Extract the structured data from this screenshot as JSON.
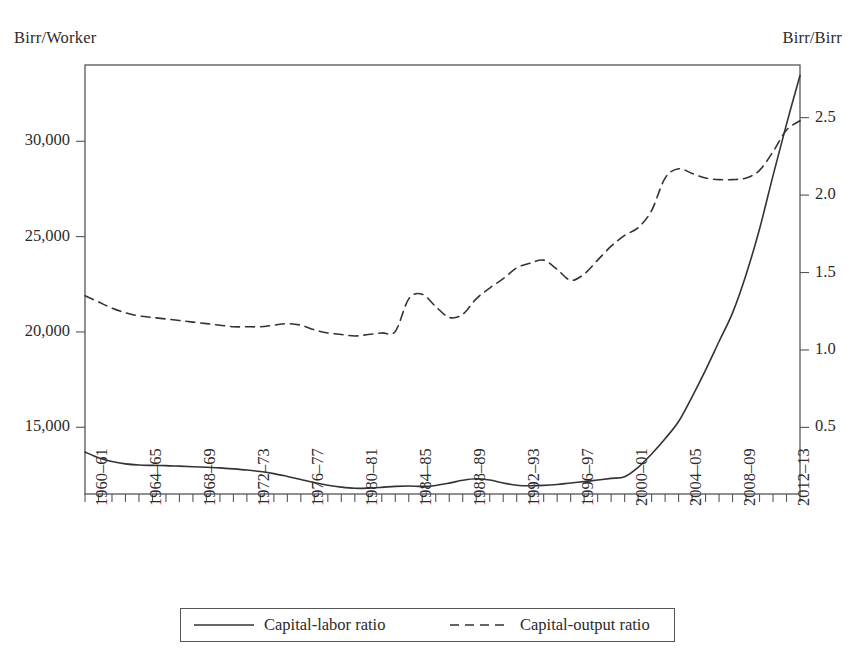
{
  "axes": {
    "left_title": "Birr/Worker",
    "right_title": "Birr/Birr",
    "left_ticks": [
      "15,000",
      "20,000",
      "25,000",
      "30,000"
    ],
    "right_ticks": [
      "0.5",
      "1.0",
      "1.5",
      "2.0",
      "2.5"
    ],
    "x_ticks": [
      "1960–61",
      "1964–65",
      "1968–69",
      "1972–73",
      "1976–77",
      "1980–81",
      "1984–85",
      "1988–89",
      "1992–93",
      "1996–97",
      "2000–01",
      "2004–05",
      "2008–09",
      "2012–13"
    ]
  },
  "legend": {
    "items": [
      {
        "label": "Capital-labor ratio",
        "style": "solid"
      },
      {
        "label": "Capital-output ratio",
        "style": "dashed"
      }
    ]
  },
  "style": {
    "line_color": "#333333",
    "axis_color": "#555555",
    "background": "#ffffff"
  },
  "chart_data": {
    "type": "line",
    "title": "",
    "xlabel": "",
    "ylabel": "Birr/Worker",
    "y2label": "Birr/Birr",
    "grid": false,
    "legend_position": "bottom",
    "ylim": [
      11500,
      34000
    ],
    "y2lim": [
      0.07,
      2.84
    ],
    "yticks": [
      15000,
      20000,
      25000,
      30000
    ],
    "y2ticks": [
      0.5,
      1.0,
      1.5,
      2.0,
      2.5
    ],
    "x": [
      "1960–61",
      "1961–62",
      "1962–63",
      "1963–64",
      "1964–65",
      "1965–66",
      "1966–67",
      "1967–68",
      "1968–69",
      "1969–70",
      "1970–71",
      "1971–72",
      "1972–73",
      "1973–74",
      "1974–75",
      "1975–76",
      "1976–77",
      "1977–78",
      "1978–79",
      "1979–80",
      "1980–81",
      "1981–82",
      "1982–83",
      "1983–84",
      "1984–85",
      "1985–86",
      "1986–87",
      "1987–88",
      "1988–89",
      "1989–90",
      "1990–91",
      "1991–92",
      "1992–93",
      "1993–94",
      "1994–95",
      "1995–96",
      "1996–97",
      "1997–98",
      "1998–99",
      "1999–2000",
      "2000–01",
      "2001–02",
      "2002–03",
      "2003–04",
      "2004–05",
      "2005–06",
      "2006–07",
      "2007–08",
      "2008–09",
      "2009–10",
      "2010–11",
      "2011–12",
      "2012–13",
      "2013–14"
    ],
    "series": [
      {
        "name": "Capital-labor ratio",
        "axis": "left",
        "style": "solid",
        "unit": "Birr/Worker",
        "values": [
          13700,
          13400,
          13200,
          13080,
          13020,
          13000,
          12990,
          12960,
          12930,
          12900,
          12870,
          12820,
          12760,
          12680,
          12570,
          12420,
          12260,
          12100,
          11960,
          11860,
          11800,
          11810,
          11850,
          11900,
          11920,
          11900,
          11950,
          12070,
          12220,
          12300,
          12230,
          12080,
          11960,
          11930,
          11950,
          12000,
          12080,
          12150,
          12230,
          12320,
          12400,
          12900,
          13600,
          14400,
          15300,
          16600,
          18000,
          19500,
          21000,
          23000,
          25400,
          28200,
          30900,
          33450
        ]
      },
      {
        "name": "Capital-output ratio",
        "axis": "right",
        "style": "dashed",
        "unit": "Birr/Birr",
        "values": [
          1.35,
          1.31,
          1.27,
          1.24,
          1.22,
          1.21,
          1.2,
          1.19,
          1.18,
          1.17,
          1.16,
          1.15,
          1.15,
          1.15,
          1.16,
          1.17,
          1.16,
          1.13,
          1.11,
          1.1,
          1.09,
          1.1,
          1.11,
          1.12,
          1.33,
          1.36,
          1.28,
          1.21,
          1.23,
          1.33,
          1.4,
          1.46,
          1.53,
          1.56,
          1.58,
          1.52,
          1.45,
          1.49,
          1.58,
          1.67,
          1.74,
          1.79,
          1.9,
          2.11,
          2.17,
          2.14,
          2.11,
          2.1,
          2.1,
          2.11,
          2.16,
          2.28,
          2.42,
          2.48
        ]
      }
    ]
  }
}
